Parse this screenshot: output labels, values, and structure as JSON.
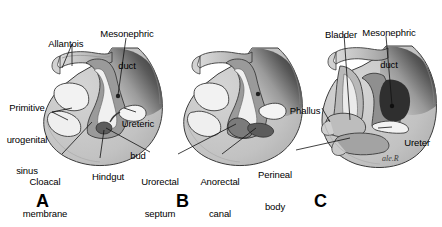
{
  "figure": {
    "background_color": "#ffffff",
    "width": 442,
    "height": 227,
    "signature": "ale.R"
  },
  "palette": {
    "outline": "#2b2b2b",
    "body_light": "#c9c9c9",
    "body_mid": "#a8a8a8",
    "tissue_mid": "#9a9a9a",
    "tissue_dark": "#6f6f6f",
    "duct_dark": "#4a4a4a",
    "very_dark": "#2e2e2e",
    "highlight": "#f2f2f2",
    "white": "#ffffff",
    "leader_line": "#1a1a1a"
  },
  "panels": [
    {
      "letter": "A",
      "letter_x": 36,
      "letter_y": 192,
      "labels": [
        {
          "name": "allantois",
          "lines": [
            "Allantois"
          ],
          "x": 50,
          "y": 32,
          "align": "center"
        },
        {
          "name": "mesonephric-duct",
          "lines": [
            "Mesonephric",
            "duct"
          ],
          "x": 108,
          "y": 14,
          "align": "center"
        },
        {
          "name": "primitive-urogenital-sinus",
          "lines": [
            "Primitive",
            "urogenital",
            "sinus"
          ],
          "x": 4,
          "y": 84,
          "align": "center"
        },
        {
          "name": "ureteric-bud",
          "lines": [
            "Ureteric",
            "bud"
          ],
          "x": 116,
          "y": 100,
          "align": "center"
        },
        {
          "name": "cloacal-membrane",
          "lines": [
            "Cloacal",
            "membrane"
          ],
          "x": 32,
          "y": 159,
          "align": "center"
        },
        {
          "name": "hindgut",
          "lines": [
            "Hindgut"
          ],
          "x": 92,
          "y": 164,
          "align": "center"
        }
      ]
    },
    {
      "letter": "B",
      "letter_x": 176,
      "letter_y": 192,
      "labels": [
        {
          "name": "urorectal-septum",
          "lines": [
            "Urorectal",
            "septum"
          ],
          "x": 147,
          "y": 159,
          "align": "center"
        },
        {
          "name": "anorectal-canal",
          "lines": [
            "Anorectal",
            "canal"
          ],
          "x": 205,
          "y": 159,
          "align": "center"
        }
      ]
    },
    {
      "letter": "C",
      "letter_x": 314,
      "letter_y": 192,
      "labels": [
        {
          "name": "bladder",
          "lines": [
            "Bladder"
          ],
          "x": 327,
          "y": 22,
          "align": "center"
        },
        {
          "name": "mesonephric-duct",
          "lines": [
            "Mesonephric",
            "duct"
          ],
          "x": 370,
          "y": 12,
          "align": "center"
        },
        {
          "name": "phallus",
          "lines": [
            "Phallus"
          ],
          "x": 293,
          "y": 98,
          "align": "center"
        },
        {
          "name": "ureter",
          "lines": [
            "Ureter"
          ],
          "x": 376,
          "y": 130,
          "align": "center"
        },
        {
          "name": "perineal-body",
          "lines": [
            "Perineal",
            "body"
          ],
          "x": 268,
          "y": 152,
          "align": "center"
        }
      ]
    }
  ]
}
